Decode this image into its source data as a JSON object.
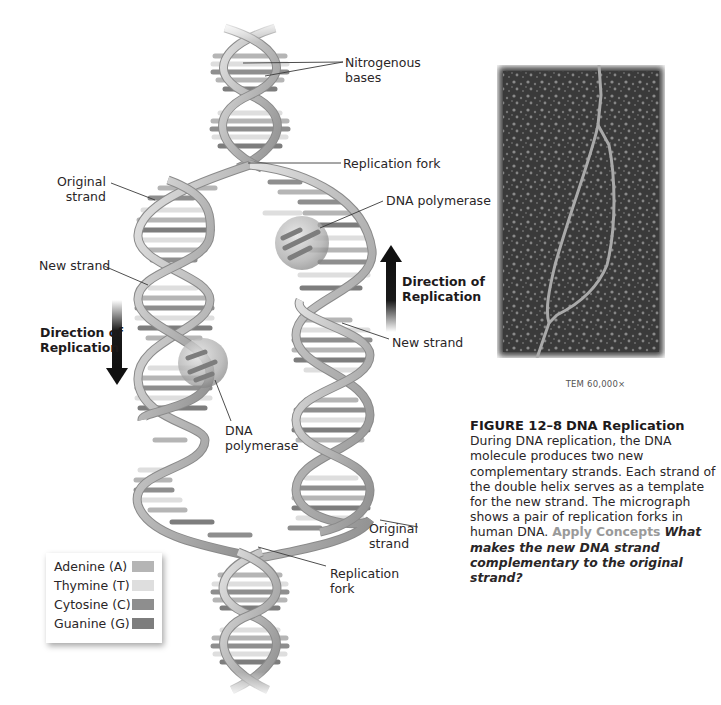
{
  "figure": {
    "number": "FIGURE 12–8",
    "title": "DNA Replication",
    "caption_body": "During DNA replication, the DNA molecule produces two new complementary strands. Each strand of the double helix serves as a template for the new strand. The micrograph shows a pair of replication forks in human DNA.",
    "apply_label": "Apply Concepts",
    "question": "What makes the new DNA strand complementary to the original strand?"
  },
  "micrograph": {
    "magnification": "TEM 60,000×"
  },
  "labels": {
    "nitrogenous_bases": "Nitrogenous\nbases",
    "replication_fork_top": "Replication fork",
    "original_strand_top": "Original\nstrand",
    "dna_polymerase_top": "DNA polymerase",
    "new_strand_left": "New strand",
    "direction_left": "Direction of\nReplication",
    "direction_right": "Direction of\nReplication",
    "new_strand_right": "New strand",
    "dna_polymerase_bottom": "DNA\npolymerase",
    "original_strand_bottom": "Original\nstrand",
    "replication_fork_bottom": "Replication\nfork"
  },
  "legend": {
    "items": [
      {
        "label": "Adenine (A)",
        "color": "#b5b5b5"
      },
      {
        "label": "Thymine (T)",
        "color": "#dedede"
      },
      {
        "label": "Cytosine (C)",
        "color": "#8e8e8e"
      },
      {
        "label": "Guanine (G)",
        "color": "#7d7d7d"
      }
    ]
  },
  "colors": {
    "backbone": "#bdbdbd",
    "backbone_edge": "#8a8a8a",
    "arrow": "#141414",
    "micrograph_bg": "#3b3b3b"
  }
}
